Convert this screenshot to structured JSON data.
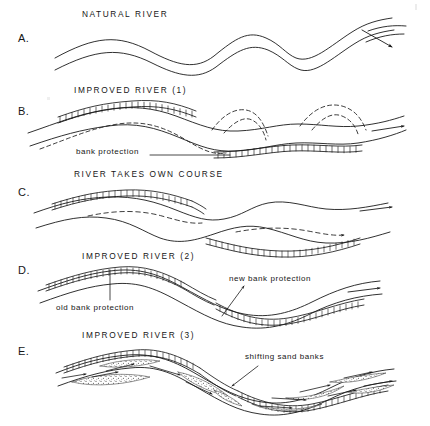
{
  "figure": {
    "background_color": "#ffffff",
    "ink_color": "#1a1a1a",
    "width": 430,
    "height": 426
  },
  "panels": [
    {
      "letter": "A.",
      "heading": "NATURAL RIVER",
      "description": "free meandering double-line channel with flow arrow"
    },
    {
      "letter": "B.",
      "heading": "IMPROVED RIVER (1)",
      "description": "channel with bank protection on outer bends, dashed former course"
    },
    {
      "letter": "C.",
      "heading": "RIVER TAKES OWN COURSE",
      "description": "river migrates away from protection, dashed abandoned channel"
    },
    {
      "letter": "D.",
      "heading": "IMPROVED RIVER (2)",
      "description": "old and new bank protection along realigned channel"
    },
    {
      "letter": "E.",
      "heading": "IMPROVED RIVER (3)",
      "description": "fully protected channel with shifting sand banks and flow arrows"
    }
  ],
  "callouts": [
    {
      "text": "bank protection",
      "panel": "B"
    },
    {
      "text": "old bank protection",
      "panel": "D"
    },
    {
      "text": "new bank protection",
      "panel": "D"
    },
    {
      "text": "shifting sand banks",
      "panel": "E"
    }
  ],
  "legend_symbols": [
    {
      "name": "bank-protection-hatch",
      "meaning": "ladder hatched band along bank"
    },
    {
      "name": "dashed-line",
      "meaning": "former or abandoned river course"
    },
    {
      "name": "stipple-band",
      "meaning": "sand bank deposit"
    },
    {
      "name": "flow-arrow",
      "meaning": "direction of flow"
    }
  ]
}
